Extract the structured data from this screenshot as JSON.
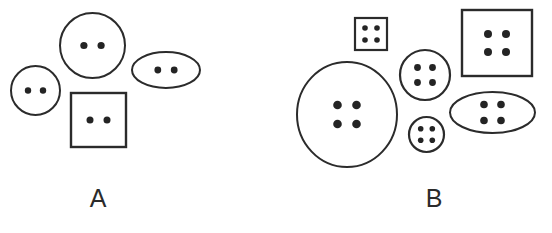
{
  "figure": {
    "background_color": "#ffffff",
    "stroke_color": "#2b2b2b",
    "hole_color": "#242424",
    "panels": [
      {
        "id": "A",
        "label": "A",
        "label_x": 98,
        "label_y": 207,
        "holes_per_item": 2,
        "item_count": 4,
        "items": [
          {
            "name": "button-large-circle",
            "shape": "circle",
            "cx": 92.5,
            "cy": 45.5,
            "rx": 32.5,
            "ry": 32.5,
            "stroke_width": 2.0,
            "hole_radius": 3.6,
            "hole_dx": 8.6,
            "hole_dy": 0,
            "holes": 2
          },
          {
            "name": "button-small-circle",
            "shape": "circle",
            "cx": 35.5,
            "cy": 90.5,
            "rx": 24.5,
            "ry": 24.5,
            "stroke_width": 2.0,
            "hole_radius": 3.2,
            "hole_dx": 7.5,
            "hole_dy": 0,
            "holes": 2
          },
          {
            "name": "button-ellipse",
            "shape": "ellipse",
            "cx": 166,
            "cy": 70,
            "rx": 34,
            "ry": 18,
            "stroke_width": 2.0,
            "hole_radius": 3.4,
            "hole_dx": 8.2,
            "hole_dy": 0,
            "holes": 2
          },
          {
            "name": "button-square",
            "shape": "square",
            "cx": 98.5,
            "cy": 120,
            "rx": 27.5,
            "ry": 27,
            "stroke_width": 2.4,
            "hole_radius": 3.5,
            "hole_dx": 8.5,
            "hole_dy": 0,
            "holes": 2
          }
        ]
      },
      {
        "id": "B",
        "label": "B",
        "label_x": 434,
        "label_y": 207,
        "holes_per_item": 4,
        "item_count": 6,
        "items": [
          {
            "name": "button-large-circle",
            "shape": "circle",
            "cx": 347,
            "cy": 114.5,
            "rx": 50,
            "ry": 52.5,
            "stroke_width": 2.0,
            "hole_radius": 4.3,
            "hole_dx": 9.5,
            "hole_dy": 9.5,
            "holes": 4
          },
          {
            "name": "button-small-square",
            "shape": "square",
            "cx": 371,
            "cy": 34,
            "rx": 16,
            "ry": 16,
            "stroke_width": 2.2,
            "hole_radius": 2.8,
            "hole_dx": 6.0,
            "hole_dy": 6.0,
            "holes": 4
          },
          {
            "name": "button-medium-circle",
            "shape": "circle",
            "cx": 425,
            "cy": 75,
            "rx": 25,
            "ry": 25,
            "stroke_width": 2.2,
            "hole_radius": 3.4,
            "hole_dx": 7.5,
            "hole_dy": 7.5,
            "holes": 4
          },
          {
            "name": "button-small-circle",
            "shape": "circle",
            "cx": 426.5,
            "cy": 134.5,
            "rx": 17.5,
            "ry": 17.5,
            "stroke_width": 2.2,
            "hole_radius": 2.8,
            "hole_dx": 5.8,
            "hole_dy": 5.8,
            "holes": 4
          },
          {
            "name": "button-large-square",
            "shape": "square",
            "cx": 497,
            "cy": 43,
            "rx": 35,
            "ry": 33,
            "stroke_width": 2.4,
            "hole_radius": 4.0,
            "hole_dx": 9.0,
            "hole_dy": 9.0,
            "holes": 4
          },
          {
            "name": "button-ellipse",
            "shape": "ellipse",
            "cx": 492.5,
            "cy": 112.5,
            "rx": 42.5,
            "ry": 20.5,
            "stroke_width": 2.0,
            "hole_radius": 3.8,
            "hole_dx": 8.5,
            "hole_dy": 8.0,
            "holes": 4
          }
        ]
      }
    ]
  }
}
